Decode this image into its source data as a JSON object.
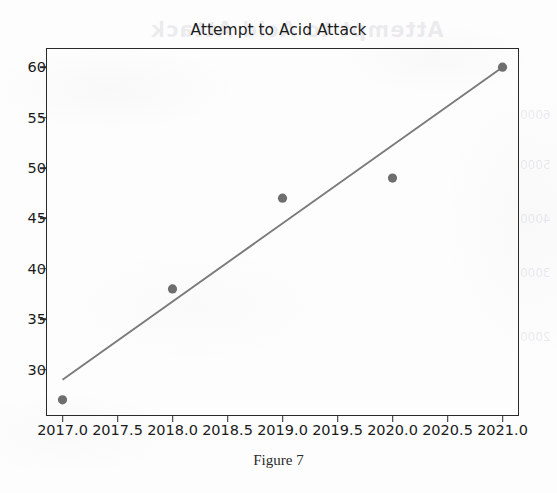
{
  "chart_data": {
    "type": "scatter",
    "title": "Attempt to Acid Attack",
    "xlabel": "",
    "ylabel": "",
    "x": [
      2017,
      2018,
      2019,
      2020,
      2021
    ],
    "values": [
      27,
      38,
      47,
      49,
      60
    ],
    "series": [
      {
        "name": "Attempt to Acid Attack",
        "type": "scatter",
        "x": [
          2017,
          2018,
          2019,
          2020,
          2021
        ],
        "values": [
          27,
          38,
          47,
          49,
          60
        ],
        "marker_color": "#6e6e6e"
      },
      {
        "name": "Trend line",
        "type": "line",
        "x": [
          2017,
          2021
        ],
        "values": [
          29,
          60
        ],
        "line_color": "#7a7a7a"
      }
    ],
    "xlim": [
      2016.85,
      2021.15
    ],
    "ylim": [
      25.4,
      61.9
    ],
    "xticks": [
      2017.0,
      2017.5,
      2018.0,
      2018.5,
      2019.0,
      2019.5,
      2020.0,
      2020.5,
      2021.0
    ],
    "xtick_labels": [
      "2017.0",
      "2017.5",
      "2018.0",
      "2018.5",
      "2019.0",
      "2019.5",
      "2020.0",
      "2020.5",
      "2021.0"
    ],
    "yticks": [
      30,
      35,
      40,
      45,
      50,
      55,
      60
    ],
    "ytick_labels": [
      "30",
      "35",
      "40",
      "45",
      "50",
      "55",
      "60"
    ],
    "grid": false,
    "legend": "none"
  },
  "caption": {
    "text": "Figure 7"
  },
  "artifacts": {
    "ghost_title": "Attempt to Acid Attack",
    "ghost_values": [
      "6000",
      "5000",
      "4000",
      "3000",
      "2000"
    ]
  }
}
